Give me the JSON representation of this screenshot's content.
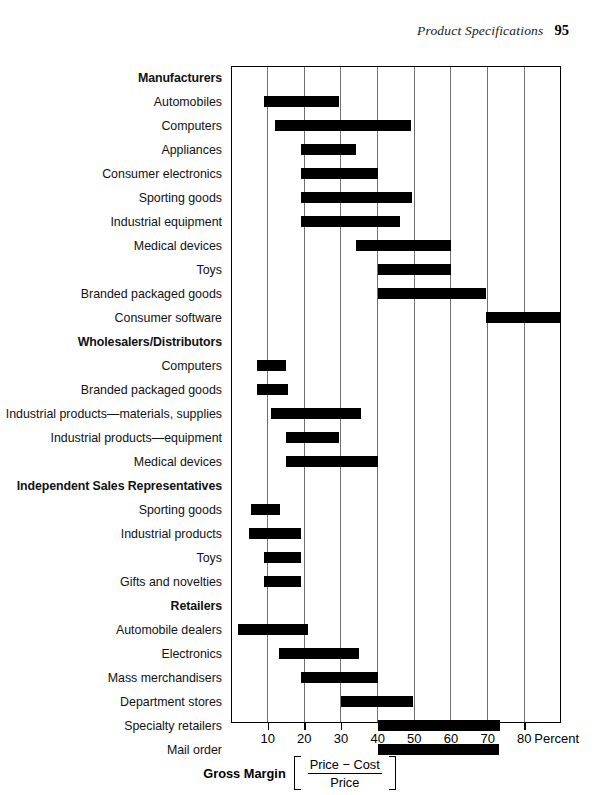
{
  "running_head": {
    "title": "Product Specifications",
    "page_number": "95"
  },
  "caption": {
    "label": "Gross Margin",
    "numerator": "Price − Cost",
    "denominator": "Price"
  },
  "axis": {
    "unit_label": "Percent",
    "ticks": [
      10,
      20,
      30,
      40,
      50,
      60,
      70,
      80
    ],
    "tick_labels": [
      "10",
      "20",
      "30",
      "40",
      "50",
      "60",
      "70",
      "80"
    ],
    "min": 0,
    "max": 90
  },
  "chart_data": {
    "type": "bar",
    "orientation": "horizontal",
    "subtype": "floating-range-bar",
    "title": "",
    "xlabel": "Gross Margin [ (Price − Cost) / Price ]",
    "ylabel": "",
    "xlim": [
      0,
      90
    ],
    "xticks": [
      10,
      20,
      30,
      40,
      50,
      60,
      70,
      80
    ],
    "xunit": "Percent",
    "grid": "vertical",
    "legend": "none",
    "bar_color": "#000000",
    "groups": [
      {
        "name": "Manufacturers",
        "items": [
          {
            "label": "Automobiles",
            "low": 9,
            "high": 29.5
          },
          {
            "label": "Computers",
            "low": 12,
            "high": 49
          },
          {
            "label": "Appliances",
            "low": 19,
            "high": 34
          },
          {
            "label": "Consumer electronics",
            "low": 19,
            "high": 40
          },
          {
            "label": "Sporting goods",
            "low": 19,
            "high": 49.5
          },
          {
            "label": "Industrial equipment",
            "low": 19,
            "high": 46
          },
          {
            "label": "Medical devices",
            "low": 34,
            "high": 60
          },
          {
            "label": "Toys",
            "low": 40,
            "high": 60
          },
          {
            "label": "Branded packaged goods",
            "low": 40,
            "high": 69.5
          },
          {
            "label": "Consumer software",
            "low": 69.5,
            "high": 90
          }
        ]
      },
      {
        "name": "Wholesalers/Distributors",
        "items": [
          {
            "label": "Computers",
            "low": 7,
            "high": 15
          },
          {
            "label": "Branded packaged goods",
            "low": 7,
            "high": 15.5
          },
          {
            "label": "Industrial products—materials, supplies",
            "low": 11,
            "high": 35.5
          },
          {
            "label": "Industrial products—equipment",
            "low": 15,
            "high": 29.5
          },
          {
            "label": "Medical devices",
            "low": 15,
            "high": 40
          }
        ]
      },
      {
        "name": "Independent Sales Representatives",
        "items": [
          {
            "label": "Sporting goods",
            "low": 5.5,
            "high": 13.5
          },
          {
            "label": "Industrial products",
            "low": 5,
            "high": 19
          },
          {
            "label": "Toys",
            "low": 9,
            "high": 19
          },
          {
            "label": "Gifts and novelties",
            "low": 9,
            "high": 19
          }
        ]
      },
      {
        "name": "Retailers",
        "items": [
          {
            "label": "Automobile dealers",
            "low": 2,
            "high": 21
          },
          {
            "label": "Electronics",
            "low": 13,
            "high": 35
          },
          {
            "label": "Mass merchandisers",
            "low": 19,
            "high": 40
          },
          {
            "label": "Department stores",
            "low": 30,
            "high": 49.5
          },
          {
            "label": "Specialty retailers",
            "low": 40,
            "high": 73.5
          },
          {
            "label": "Mail order",
            "low": 40,
            "high": 73
          }
        ]
      }
    ]
  }
}
